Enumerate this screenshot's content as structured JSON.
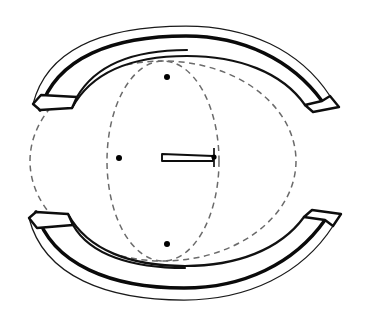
{
  "figure": {
    "type": "engineering-line-drawing",
    "width": 371,
    "height": 325,
    "background_color": "#ffffff",
    "stroke_color": "#0a0a0a",
    "dashed_stroke_color": "#6b6b6b",
    "label": ""
  },
  "geometry": {
    "center": {
      "x": 186,
      "y": 161
    },
    "construction_circle": {
      "name": "large-dashed-circle",
      "cx": 163,
      "cy": 161,
      "rx": 133,
      "ry": 100,
      "style": "dashed"
    },
    "construction_ellipse": {
      "name": "foreshortened-dashed-ellipse",
      "cx": 163,
      "cy": 161,
      "rx": 56,
      "ry": 100,
      "style": "dashed"
    },
    "nodes": [
      {
        "name": "node-top-intersection",
        "x": 167,
        "y": 77,
        "r": 3.0
      },
      {
        "name": "node-bottom-intersection",
        "x": 167,
        "y": 244,
        "r": 3.0
      },
      {
        "name": "node-left-axis",
        "x": 119,
        "y": 158,
        "r": 3.0
      },
      {
        "name": "node-needle-tip",
        "x": 214,
        "y": 157,
        "r": 2.6
      }
    ],
    "needle": {
      "name": "center-needle-sliver",
      "points": "162,154 213,156 213,161 162,161",
      "tick_x": 214,
      "tick_y1": 148,
      "tick_y2": 167
    },
    "top_band": {
      "name": "upper-curved-band",
      "outer_arc": "M 33,104 C 48,45 110,26 186,26 C 248,26 300,50 330,96",
      "mid_arc": "M 40,110 C 56,57 114,36 186,36 C 243,36 292,60 322,101",
      "inner_arc": "M 72,108 C 92,71 134,56 187,56 C 238,56 282,72 305,105",
      "face_left": "33,104 40,110 72,108 77,97 41,95",
      "face_right": "330,96 322,101 305,105 313,112 339,107"
    },
    "bottom_band": {
      "name": "lower-curved-band",
      "outer_arc": "M 29,218 C 44,277 108,300 184,300 C 248,300 302,274 333,226",
      "mid_arc": "M 36,212 C 52,265 112,288 184,288 C 243,288 294,264 325,220",
      "inner_arc": "M 68,214 C 88,251 132,266 185,266 C 236,266 280,250 304,217",
      "face_left": "29,218 36,212 68,214 73,225 37,228",
      "face_right": "333,226 325,220 304,217 312,210 341,214"
    }
  },
  "annotations": {
    "visible_text": [],
    "dimension_labels": []
  }
}
